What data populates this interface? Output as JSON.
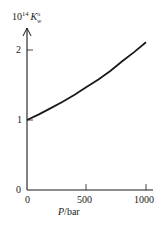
{
  "chart_data": {
    "type": "line",
    "title": "",
    "xlabel": "P/bar",
    "ylabel": "10^14 K°w",
    "ylabel_parts": {
      "prefix": "10",
      "exponent": "14",
      "symbol": "K",
      "superscript": "o",
      "subscript": "w"
    },
    "xlim": [
      0,
      1050
    ],
    "ylim": [
      0,
      2.4
    ],
    "x_ticks": [
      "0",
      "500",
      "1000"
    ],
    "y_ticks": [
      "0",
      "1",
      "2"
    ],
    "grid": false,
    "legend": null,
    "series": [
      {
        "name": "Kw(P)",
        "x": [
          0,
          100,
          200,
          300,
          400,
          500,
          600,
          700,
          800,
          900,
          1000
        ],
        "y": [
          1.0,
          1.08,
          1.17,
          1.26,
          1.36,
          1.47,
          1.58,
          1.7,
          1.84,
          1.97,
          2.11
        ]
      }
    ]
  }
}
